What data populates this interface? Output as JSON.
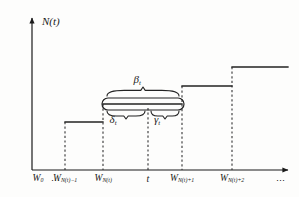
{
  "figure": {
    "kind": "step-function-renewal-process-diagram",
    "axes": {
      "y_label": "N(t)",
      "x_label": "",
      "origin": {
        "x": 32,
        "y": 170
      },
      "y_top": 14,
      "x_right": 293,
      "axis_color": "#1a1a1a"
    },
    "x_ticks": [
      {
        "id": "w0",
        "label_main": "W",
        "label_sub": "0",
        "x": 38
      },
      {
        "id": "ellipsis-left",
        "label_main": "⋯",
        "label_sub": "",
        "x": 56
      },
      {
        "id": "wn-minus-1",
        "label_main": "W",
        "label_sub": "N(t)−1",
        "x": 65
      },
      {
        "id": "wn",
        "label_main": "W",
        "label_sub": "N(t)",
        "x": 103
      },
      {
        "id": "t",
        "label_main": "t",
        "label_sub": "",
        "x": 148
      },
      {
        "id": "wn-plus-1",
        "label_main": "W",
        "label_sub": "N(t)+1",
        "x": 182
      },
      {
        "id": "wn-plus-2",
        "label_main": "W",
        "label_sub": "N(t)+2",
        "x": 232
      },
      {
        "id": "ellipsis-right",
        "label_main": "⋯",
        "label_sub": "",
        "x": 281
      }
    ],
    "dashed_verticals": [
      {
        "id": "drop-wn-minus-1",
        "x": 65,
        "y_top": 122,
        "y_bottom": 170
      },
      {
        "id": "drop-wn",
        "x": 103,
        "y_top": 104,
        "y_bottom": 170
      },
      {
        "id": "drop-t",
        "x": 148,
        "y_top": 108,
        "y_bottom": 170
      },
      {
        "id": "drop-wn-plus-1",
        "x": 182,
        "y_top": 86,
        "y_bottom": 170
      },
      {
        "id": "drop-wn-plus-2",
        "x": 232,
        "y_top": 67,
        "y_bottom": 170
      }
    ],
    "steps": [
      {
        "id": "step-1",
        "x_start": 65,
        "x_end": 103,
        "y": 122
      },
      {
        "id": "step-2",
        "x_start": 103,
        "x_end": 182,
        "y": 104
      },
      {
        "id": "step-3",
        "x_start": 182,
        "x_end": 232,
        "y": 86
      },
      {
        "id": "step-4",
        "x_start": 232,
        "x_end": 288,
        "y": 67
      }
    ],
    "capsule": {
      "id": "interval-capsule",
      "x_start": 102,
      "x_end": 184,
      "y_top": 98,
      "y_bottom": 110
    },
    "braces": {
      "beta": {
        "symbol": "β",
        "subscript": "t",
        "label_x": 137,
        "label_y": 74,
        "span_start": 107,
        "span_end": 179,
        "brace_y": 96,
        "peak_y": 87
      },
      "delta": {
        "symbol": "δ",
        "subscript": "t",
        "label_x": 113,
        "label_y": 114,
        "span_start": 107,
        "span_end": 145,
        "brace_y": 111,
        "peak_y": 119
      },
      "gamma": {
        "symbol": "γ",
        "subscript": "t",
        "label_x": 157,
        "label_y": 114,
        "span_start": 151,
        "span_end": 179,
        "brace_y": 111,
        "peak_y": 119
      }
    },
    "colors": {
      "ink": "#1a1a1a",
      "line": "#222222",
      "dash": "#333333",
      "background": "#fdfdfc"
    }
  }
}
